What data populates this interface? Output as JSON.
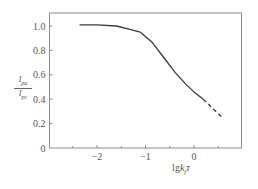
{
  "chart_data": {
    "type": "line",
    "title": "",
    "xlabel": "lgk_f τ",
    "ylabel": "I_pa / I_pc",
    "xlim": [
      -3.0,
      1.0
    ],
    "ylim": [
      0,
      1.1
    ],
    "grid": false,
    "legend": null,
    "x_ticks": [
      -2,
      -1,
      0
    ],
    "x_tick_labels": [
      "−2",
      "−1",
      "0"
    ],
    "x_minor_ticks": [
      -2.5,
      -1.5,
      -0.5,
      0.5
    ],
    "y_ticks": [
      0,
      0.2,
      0.4,
      0.6,
      0.8,
      1.0
    ],
    "y_tick_labels": [
      "0",
      "0.2",
      "0.4",
      "0.6",
      "0.8",
      "1.0"
    ],
    "series": [
      {
        "name": "measured (solid)",
        "style": "solid",
        "x": [
          -2.36,
          -2.0,
          -1.6,
          -1.3,
          -1.11,
          -0.87,
          -0.64,
          -0.39,
          -0.16,
          0.0,
          0.19
        ],
        "y": [
          1.01,
          1.01,
          1.0,
          0.97,
          0.95,
          0.87,
          0.75,
          0.62,
          0.52,
          0.46,
          0.4
        ]
      },
      {
        "name": "extrapolated (dashed)",
        "style": "dashed",
        "x": [
          0.19,
          0.4,
          0.58
        ],
        "y": [
          0.4,
          0.32,
          0.25
        ]
      }
    ]
  },
  "labels": {
    "ylabel_num": "I",
    "ylabel_num_sub": "pa",
    "ylabel_den": "I",
    "ylabel_den_sub": "pc",
    "xlabel_prefix": "lg",
    "xlabel_k": "k",
    "xlabel_sub": "f",
    "xlabel_tau": "τ"
  },
  "colors": {
    "frame": "#8a8a8a",
    "curve": "#3a3a3a",
    "text": "#555555"
  }
}
